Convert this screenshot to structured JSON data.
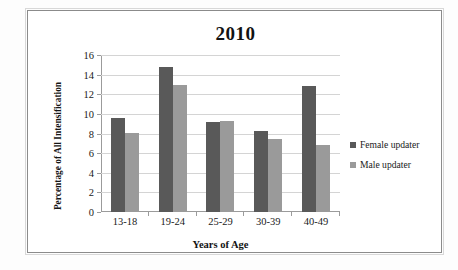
{
  "chart_data": {
    "type": "bar",
    "title": "2010",
    "xlabel": "Years of Age",
    "ylabel": "Percentage of All Intensification",
    "categories": [
      "13-18",
      "19-24",
      "25-29",
      "30-39",
      "40-49"
    ],
    "series": [
      {
        "name": "Female updater",
        "color": "#595959",
        "values": [
          9.6,
          14.8,
          9.2,
          8.3,
          12.8
        ]
      },
      {
        "name": "Male updater",
        "color": "#9a9a9a",
        "values": [
          8.1,
          12.9,
          9.3,
          7.45,
          6.85
        ]
      }
    ],
    "ylim": [
      0,
      16
    ],
    "ytick_step": 2,
    "yticks": [
      0,
      2,
      4,
      6,
      8,
      10,
      12,
      14,
      16
    ],
    "grid": true,
    "legend_position": "right"
  }
}
